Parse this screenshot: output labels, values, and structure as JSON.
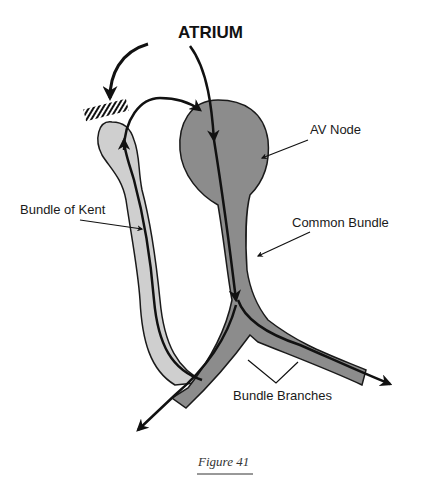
{
  "diagram": {
    "title": "ATRIUM",
    "labels": {
      "av_node": "AV Node",
      "bundle_of_kent": "Bundle of Kent",
      "common_bundle": "Common Bundle",
      "bundle_branches": "Bundle Branches"
    },
    "caption": "Figure 41",
    "colors": {
      "av_pathway": "#8c8c8c",
      "kent_pathway": "#cfcfcf",
      "outline": "#1a1a1a",
      "arrow": "#111111"
    }
  }
}
